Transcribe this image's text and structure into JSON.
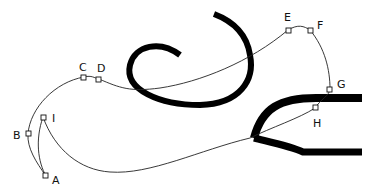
{
  "diagram": {
    "type": "bezier-path-construction",
    "background": "#ffffff",
    "stroke_color": "#000000",
    "points": [
      {
        "id": "A",
        "label": "A",
        "x": 46,
        "y": 176
      },
      {
        "id": "B",
        "label": "B",
        "x": 28,
        "y": 134
      },
      {
        "id": "C",
        "label": "C",
        "x": 84,
        "y": 77
      },
      {
        "id": "D",
        "label": "D",
        "x": 99,
        "y": 79
      },
      {
        "id": "E",
        "label": "E",
        "x": 288,
        "y": 30
      },
      {
        "id": "F",
        "label": "F",
        "x": 310,
        "y": 30
      },
      {
        "id": "G",
        "label": "G",
        "x": 330,
        "y": 89
      },
      {
        "id": "H",
        "label": "H",
        "x": 315,
        "y": 108
      },
      {
        "id": "I",
        "label": "I",
        "x": 43,
        "y": 117
      }
    ],
    "shapes": [
      {
        "name": "spiral-stroke",
        "description": "thick black curl/spiral shape"
      },
      {
        "name": "fork-stroke",
        "description": "thick black Y/fork shape with two horizontal prongs"
      },
      {
        "name": "thin-path",
        "description": "thin closed bezier path through anchor points A-I"
      }
    ]
  }
}
